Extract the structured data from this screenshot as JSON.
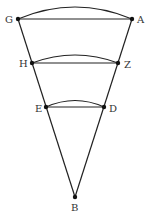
{
  "diagram": {
    "title": "",
    "colors": {
      "line": "#222222",
      "point": "#111111",
      "label": "#333333",
      "background": "#ffffff"
    },
    "points": [
      {
        "id": "G",
        "label": "G",
        "x": 18,
        "y": 19,
        "lx": 5,
        "ly": 23
      },
      {
        "id": "A",
        "label": "A",
        "x": 132,
        "y": 19,
        "lx": 137,
        "ly": 23
      },
      {
        "id": "H",
        "label": "H",
        "x": 32,
        "y": 63,
        "lx": 19,
        "ly": 67
      },
      {
        "id": "Z",
        "label": "Z",
        "x": 118,
        "y": 63,
        "lx": 124,
        "ly": 68
      },
      {
        "id": "E",
        "label": "E",
        "x": 46,
        "y": 107,
        "lx": 35,
        "ly": 112
      },
      {
        "id": "D",
        "label": "D",
        "x": 104,
        "y": 107,
        "lx": 109,
        "ly": 112
      },
      {
        "id": "B",
        "label": "B",
        "x": 75,
        "y": 197,
        "lx": 71,
        "ly": 211
      }
    ],
    "segments": [
      [
        "G",
        "A"
      ],
      [
        "H",
        "Z"
      ],
      [
        "E",
        "D"
      ],
      [
        "G",
        "B"
      ],
      [
        "A",
        "B"
      ]
    ],
    "arcs": [
      {
        "from": "G",
        "to": "A",
        "peak_y": 7
      },
      {
        "from": "H",
        "to": "Z",
        "peak_y": 56
      },
      {
        "from": "E",
        "to": "D",
        "peak_y": 101
      }
    ]
  }
}
